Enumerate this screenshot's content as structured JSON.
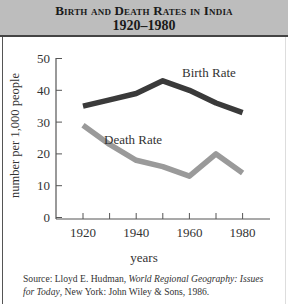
{
  "header": {
    "title": "Birth and Death Rates in India",
    "subtitle": "1920–1980"
  },
  "axes": {
    "ylabel": "number per 1,000 people",
    "xlabel": "years",
    "yticks": [
      "0",
      "10",
      "20",
      "30",
      "40",
      "50"
    ],
    "xticks": [
      "1920",
      "1940",
      "1960",
      "1980"
    ]
  },
  "legend": {
    "birth": "Birth Rate",
    "death": "Death Rate"
  },
  "source": {
    "prefix": "Source: Lloyd E. Hudman, ",
    "title_part1": "World Regional Geography: Issues",
    "title_part2": "for Today",
    "suffix": ", New York: John Wiley & Sons, 1986."
  },
  "colors": {
    "birth_line": "#3a3a3a",
    "death_line": "#9a9a9a",
    "header_bg": "#bdbdbd"
  },
  "chart_data": {
    "type": "line",
    "title": "Birth and Death Rates in India 1920–1980",
    "xlabel": "years",
    "ylabel": "number per 1,000 people",
    "x": [
      1920,
      1930,
      1940,
      1950,
      1960,
      1970,
      1980
    ],
    "series": [
      {
        "name": "Birth Rate",
        "values": [
          35,
          37,
          39,
          43,
          40,
          36,
          33
        ]
      },
      {
        "name": "Death Rate",
        "values": [
          29,
          23,
          18,
          16,
          13,
          20,
          14
        ]
      }
    ],
    "ylim": [
      0,
      50
    ],
    "xlim": [
      1910,
      1990
    ],
    "yticks": [
      0,
      10,
      20,
      30,
      40,
      50
    ],
    "xticks": [
      1920,
      1940,
      1960,
      1980
    ],
    "grid": false,
    "legend": "inline labels"
  }
}
